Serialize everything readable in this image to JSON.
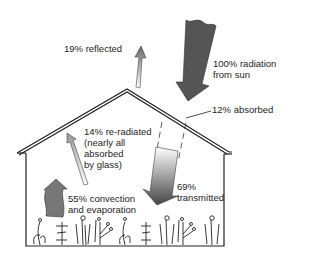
{
  "diagram": {
    "labels": {
      "reflected": "19% reflected",
      "sun_line1": "100% radiation",
      "sun_line2": "from sun",
      "absorbed": "12% absorbed",
      "reradiated_line1": "14% re-radiated",
      "reradiated_line2": "(nearly all",
      "reradiated_line3": "absorbed",
      "reradiated_line4": "by glass)",
      "convection_line1": "55% convection",
      "convection_line2": "and evaporation",
      "transmitted_line1": "69%",
      "transmitted_line2": "transmitted"
    },
    "flows": [
      {
        "name": "radiation from sun",
        "percent": 100
      },
      {
        "name": "reflected",
        "percent": 19
      },
      {
        "name": "absorbed",
        "percent": 12
      },
      {
        "name": "transmitted",
        "percent": 69
      },
      {
        "name": "re-radiated",
        "percent": 14
      },
      {
        "name": "convection and evaporation",
        "percent": 55
      }
    ],
    "colors": {
      "arrow_dark": "#555555",
      "outline": "#222222",
      "background": "#ffffff"
    }
  }
}
